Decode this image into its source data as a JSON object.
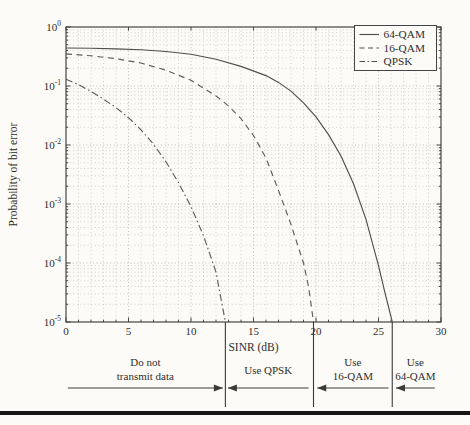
{
  "figure": {
    "paper_color": "#fcfbf7",
    "frame_color": "#454545",
    "grid_color": "#c6c6c6",
    "text_color": "#2e2e2e",
    "bottom_rule_color": "#161616"
  },
  "chart_data": {
    "type": "line",
    "title": "",
    "xlabel": "SINR (dB)",
    "ylabel": "Probability of bit error",
    "x_axis": {
      "min": 0,
      "max": 30,
      "ticks": [
        0,
        5,
        10,
        15,
        20,
        25,
        30
      ],
      "minor_step": 1
    },
    "y_axis": {
      "scale": "log",
      "max_exp": 0,
      "min_exp": -5,
      "tick_exponents": [
        0,
        -1,
        -2,
        -3,
        -4,
        -5
      ]
    },
    "grid": {
      "major": true,
      "minor": true
    },
    "legend": {
      "position": "top-right",
      "entries": [
        {
          "label": "64-QAM",
          "style": "solid"
        },
        {
          "label": "16-QAM",
          "style": "dashed"
        },
        {
          "label": "QPSK",
          "style": "dashdot"
        }
      ]
    },
    "series": [
      {
        "name": "64-QAM",
        "style": "solid",
        "color": "#4f4f4f",
        "points": [
          [
            0,
            0.44
          ],
          [
            2,
            0.435
          ],
          [
            4,
            0.425
          ],
          [
            6,
            0.41
          ],
          [
            8,
            0.385
          ],
          [
            10,
            0.345
          ],
          [
            12,
            0.285
          ],
          [
            14,
            0.215
          ],
          [
            16,
            0.15
          ],
          [
            17,
            0.115
          ],
          [
            18,
            0.082
          ],
          [
            19,
            0.052
          ],
          [
            20,
            0.03
          ],
          [
            21,
            0.015
          ],
          [
            22,
            0.0065
          ],
          [
            23,
            0.0022
          ],
          [
            24,
            0.00055
          ],
          [
            25,
            9e-05
          ],
          [
            25.5,
            3.2e-05
          ],
          [
            26.1,
            1e-05
          ]
        ]
      },
      {
        "name": "16-QAM",
        "style": "dashed",
        "color": "#5d5d5d",
        "points": [
          [
            0,
            0.35
          ],
          [
            2,
            0.325
          ],
          [
            4,
            0.29
          ],
          [
            6,
            0.245
          ],
          [
            8,
            0.185
          ],
          [
            10,
            0.125
          ],
          [
            12,
            0.068
          ],
          [
            13,
            0.046
          ],
          [
            14,
            0.028
          ],
          [
            15,
            0.0145
          ],
          [
            16,
            0.006
          ],
          [
            17,
            0.0017
          ],
          [
            18,
            0.00045
          ],
          [
            19,
            0.0001
          ],
          [
            19.4,
            4e-05
          ],
          [
            19.8,
            1e-05
          ]
        ]
      },
      {
        "name": "QPSK",
        "style": "dashdot",
        "color": "#5d5d5d",
        "points": [
          [
            0,
            0.13
          ],
          [
            1,
            0.105
          ],
          [
            2,
            0.081
          ],
          [
            3,
            0.06
          ],
          [
            4,
            0.043
          ],
          [
            5,
            0.029
          ],
          [
            6,
            0.018
          ],
          [
            7,
            0.0103
          ],
          [
            8,
            0.0052
          ],
          [
            9,
            0.0023
          ],
          [
            10,
            0.0009
          ],
          [
            11,
            0.00029
          ],
          [
            12,
            7e-05
          ],
          [
            12.75,
            1e-05
          ]
        ]
      }
    ],
    "threshold_lines_db": [
      12.75,
      19.8,
      26.1
    ],
    "region_annotations": [
      {
        "lines": [
          "Do not",
          "transmit data"
        ],
        "x_from_db": 0.15,
        "x_to_db": 12.55,
        "arrow_head": "right"
      },
      {
        "lines": [
          "Use QPSK"
        ],
        "x_from_db": 12.95,
        "x_to_db": 19.4,
        "arrow_head": "left"
      },
      {
        "lines": [
          "Use",
          "16-QAM"
        ],
        "x_from_db": 20.1,
        "x_to_db": 25.8,
        "arrow_head": "left"
      },
      {
        "lines": [
          "Use",
          "64-QAM"
        ],
        "x_from_db": 26.4,
        "x_to_db": 29.5,
        "arrow_head": "left"
      }
    ]
  }
}
